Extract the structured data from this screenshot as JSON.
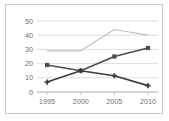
{
  "chart_data": {
    "type": "line",
    "title": "",
    "xlabel": "",
    "ylabel": "",
    "x": [
      1995,
      2000,
      2005,
      2010
    ],
    "categories": [
      "1995",
      "2000",
      "2005",
      "2010"
    ],
    "xlim": [
      1993.5,
      2011.5
    ],
    "ylim": [
      0,
      50
    ],
    "yticks": [
      0,
      10,
      20,
      30,
      40,
      50
    ],
    "ytick_labels": [
      "0",
      "10",
      "20",
      "30",
      "40",
      "50"
    ],
    "xtick_labels": [
      "1995",
      "2000",
      "2005",
      "2010"
    ],
    "grid": true,
    "grid_axis": "y",
    "legend": "none",
    "series": [
      {
        "name": "series-light-gray",
        "color": "#c0c0c0",
        "marker": "none",
        "values": [
          29,
          29,
          44,
          40
        ]
      },
      {
        "name": "series-rising-square",
        "color": "#4d4d4d",
        "marker": "square",
        "values": [
          19,
          15,
          25,
          31
        ]
      },
      {
        "name": "series-falling-cross",
        "color": "#3c3c3c",
        "marker": "cross",
        "values": [
          7,
          15,
          11.5,
          4.5
        ]
      }
    ]
  },
  "frame": {
    "border_color": "#c8c8c8",
    "background": "#ffffff"
  }
}
